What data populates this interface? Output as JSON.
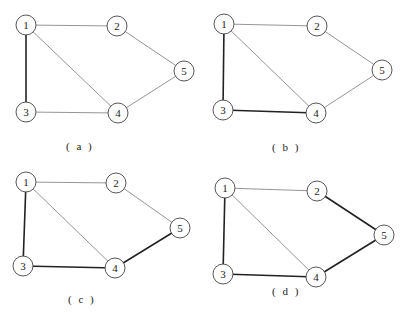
{
  "figure": {
    "nodes": [
      "1",
      "2",
      "3",
      "4",
      "5"
    ],
    "edges": [
      [
        "1",
        "2"
      ],
      [
        "1",
        "3"
      ],
      [
        "1",
        "4"
      ],
      [
        "2",
        "5"
      ],
      [
        "3",
        "4"
      ],
      [
        "4",
        "5"
      ]
    ],
    "colors": {
      "normal_edge": "#7a7a7a",
      "bold_edge": "#222222",
      "node_stroke": "#444444",
      "text": "#222222"
    },
    "panels": [
      {
        "caption": "( a )",
        "bold_edges": [
          [
            "1",
            "3"
          ]
        ]
      },
      {
        "caption": "( b )",
        "bold_edges": [
          [
            "1",
            "3"
          ],
          [
            "3",
            "4"
          ]
        ]
      },
      {
        "caption": "( c )",
        "bold_edges": [
          [
            "1",
            "3"
          ],
          [
            "3",
            "4"
          ],
          [
            "4",
            "5"
          ]
        ]
      },
      {
        "caption": "( d )",
        "bold_edges": [
          [
            "1",
            "3"
          ],
          [
            "3",
            "4"
          ],
          [
            "4",
            "5"
          ],
          [
            "2",
            "5"
          ]
        ]
      }
    ]
  }
}
